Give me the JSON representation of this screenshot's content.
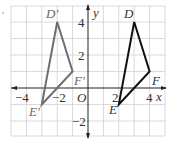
{
  "diagram": {
    "type": "coordinate-plane-reflection",
    "axes": {
      "x_label": "x",
      "y_label": "y",
      "origin_label": "O",
      "x_range": [
        -5,
        5
      ],
      "y_range": [
        -3,
        5
      ],
      "x_ticks": [
        {
          "value": -4,
          "label": "−4"
        },
        {
          "value": -2,
          "label": "−2"
        },
        {
          "value": 2,
          "label": "2"
        },
        {
          "value": 4,
          "label": "4"
        }
      ],
      "y_ticks": [
        {
          "value": 4,
          "label": "4"
        },
        {
          "value": 2,
          "label": "2"
        },
        {
          "value": -2,
          "label": "−2"
        }
      ]
    },
    "triangles": [
      {
        "name": "DEF",
        "color": "#111111",
        "vertices": [
          {
            "label": "D",
            "x": 3,
            "y": 4
          },
          {
            "label": "E",
            "x": 2,
            "y": -1
          },
          {
            "label": "F",
            "x": 4,
            "y": 1
          }
        ]
      },
      {
        "name": "D'E'F'",
        "color": "#6e6e6e",
        "vertices": [
          {
            "label": "D′",
            "x": -2,
            "y": 4
          },
          {
            "label": "E′",
            "x": -3,
            "y": -1
          },
          {
            "label": "F′",
            "x": -1,
            "y": 1
          }
        ]
      }
    ]
  }
}
